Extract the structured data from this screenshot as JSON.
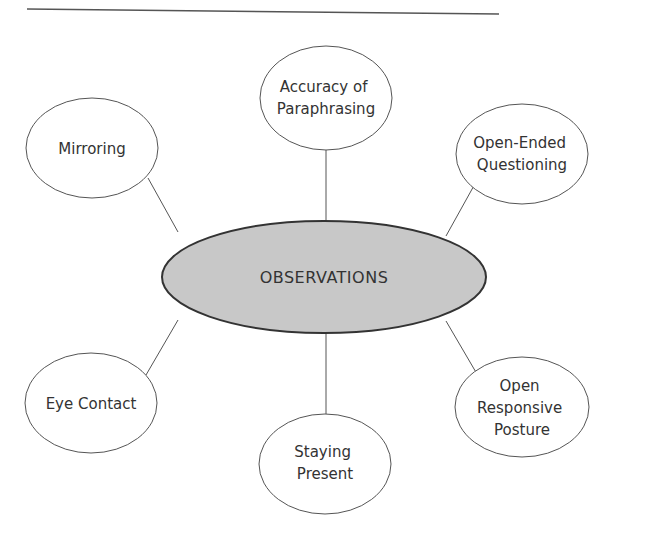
{
  "diagram": {
    "type": "mind-map",
    "center": {
      "label": "OBSERVATIONS",
      "fill": "#c8c8c8"
    },
    "nodes": [
      {
        "id": "accuracy",
        "lines": [
          "Accuracy of",
          "Paraphrasing"
        ]
      },
      {
        "id": "mirroring",
        "lines": [
          "Mirroring"
        ]
      },
      {
        "id": "open-ended",
        "lines": [
          "Open-Ended",
          "Questioning"
        ]
      },
      {
        "id": "eye-contact",
        "lines": [
          "Eye Contact"
        ]
      },
      {
        "id": "staying-present",
        "lines": [
          "Staying",
          "Present"
        ]
      },
      {
        "id": "open-responsive",
        "lines": [
          "Open",
          "Responsive",
          "Posture"
        ]
      }
    ]
  }
}
